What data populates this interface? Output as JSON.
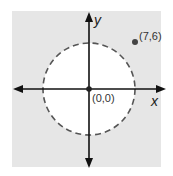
{
  "diagram": {
    "axes": {
      "x_label": "x",
      "y_label": "y"
    },
    "origin": {
      "label": "(0,0)"
    },
    "point": {
      "label": "(7,6)",
      "x": 7,
      "y": 6
    },
    "circle": {
      "center": "(0,0)",
      "style": "dashed",
      "interior": "white"
    },
    "colors": {
      "background": "#e6e6e6",
      "circle_fill": "#ffffff",
      "circle_stroke": "#555555",
      "axes": "#111111",
      "point": "#444444"
    }
  }
}
